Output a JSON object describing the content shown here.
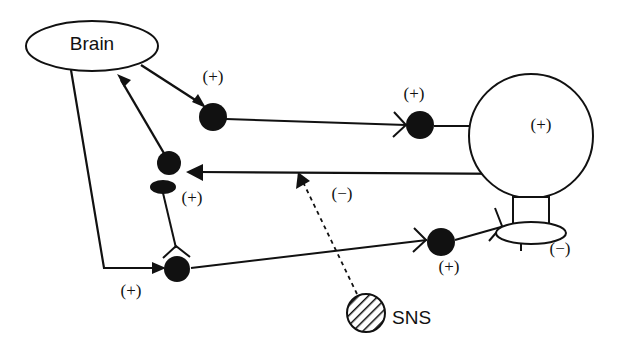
{
  "figure": {
    "type": "neural-circuit-diagram",
    "background_color": "#ffffff",
    "ink_color": "#111111",
    "width": 617,
    "height": 352
  },
  "nodes": {
    "brain": {
      "label": "Brain",
      "shape": "ellipse-open",
      "cx": 92,
      "cy": 46,
      "rx": 66,
      "ry": 25
    },
    "organ": {
      "label": "",
      "shape": "circle-open",
      "cx": 531,
      "cy": 136,
      "r": 62
    },
    "sns": {
      "label": "SNS",
      "shape": "circle-hatched",
      "cx": 366,
      "cy": 313,
      "r": 19,
      "text_x": 392,
      "text_y": 319
    },
    "n1": {
      "shape": "circle-filled",
      "cx": 213,
      "cy": 117,
      "r": 14
    },
    "n2": {
      "shape": "circle-filled",
      "cx": 169,
      "cy": 163,
      "r": 12
    },
    "n3": {
      "shape": "ellipse-filled",
      "cx": 163,
      "cy": 187,
      "rx": 13,
      "ry": 7
    },
    "n4": {
      "shape": "circle-filled",
      "cx": 177,
      "cy": 269,
      "r": 13
    },
    "n5": {
      "shape": "circle-filled",
      "cx": 420,
      "cy": 125,
      "r": 14
    },
    "n6": {
      "shape": "circle-filled",
      "cx": 441,
      "cy": 242,
      "r": 14
    }
  },
  "labels": [
    {
      "name": "plus-near-n1",
      "text": "(+)",
      "x": 213,
      "y": 78,
      "style": "sign"
    },
    {
      "name": "plus-near-n5",
      "text": "(+)",
      "x": 414,
      "y": 95,
      "style": "sign"
    },
    {
      "name": "plus-inside-organ",
      "text": "(+)",
      "x": 541,
      "y": 126,
      "style": "sign"
    },
    {
      "name": "plus-near-n3",
      "text": "(+)",
      "x": 192,
      "y": 199,
      "style": "sign"
    },
    {
      "name": "minus-dashed",
      "text": "(−)",
      "x": 342,
      "y": 195,
      "style": "sign"
    },
    {
      "name": "plus-near-n4",
      "text": "(+)",
      "x": 131,
      "y": 292,
      "style": "sign"
    },
    {
      "name": "plus-near-n6",
      "text": "(+)",
      "x": 449,
      "y": 268,
      "style": "sign"
    },
    {
      "name": "minus-near-bulb",
      "text": "(−)",
      "x": 560,
      "y": 250,
      "style": "sign"
    }
  ],
  "edges": [
    {
      "name": "brain-to-n1",
      "kind": "solid-arrow",
      "note": "excitatory output from brain"
    },
    {
      "name": "n2-to-brain",
      "kind": "solid-arrow",
      "note": "afferent feedback into brain"
    },
    {
      "name": "brain-down-to-n4",
      "kind": "solid-arrow-elbow",
      "note": "descending pathway to n4"
    },
    {
      "name": "n1-to-n5",
      "kind": "solid-fork",
      "note": "long horizontal projection"
    },
    {
      "name": "n5-to-organ",
      "kind": "solid-fork",
      "note": "terminal on organ"
    },
    {
      "name": "organ-to-n2",
      "kind": "solid-arrow",
      "note": "organ feedback to n2"
    },
    {
      "name": "n3-to-n4",
      "kind": "solid-fork",
      "note": "local connection with fork terminal"
    },
    {
      "name": "n4-to-n6",
      "kind": "solid-fork",
      "note": "ascending pathway to n6"
    },
    {
      "name": "n6-to-bulb",
      "kind": "solid-fork",
      "note": "terminal onto bulb structure"
    },
    {
      "name": "sns-to-organ-line",
      "kind": "dashed-arrow",
      "note": "inhibitory SNS modulation"
    }
  ],
  "bulb": {
    "name": "terminal-bulb",
    "neck": {
      "x": 513,
      "y": 197,
      "w": 36,
      "h": 36
    },
    "ellipse": {
      "cx": 531,
      "cy": 233,
      "rx": 35,
      "ry": 11
    },
    "stem": {
      "x": 521,
      "y": 233,
      "h": 18
    }
  }
}
